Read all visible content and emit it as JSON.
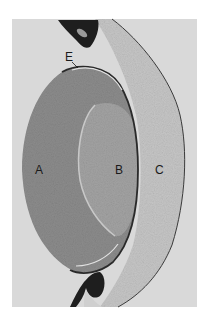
{
  "figure": {
    "type": "grayscale histology micrograph",
    "labels": [
      {
        "id": "A",
        "text": "A",
        "x": 35,
        "y": 164
      },
      {
        "id": "B",
        "text": "B",
        "x": 115,
        "y": 164
      },
      {
        "id": "C",
        "text": "C",
        "x": 155,
        "y": 164
      },
      {
        "id": "E",
        "text": "E",
        "x": 65,
        "y": 51
      }
    ],
    "colors": {
      "background": "#d9d9d9",
      "region_a": "#8c8c8c",
      "region_b": "#a3a3a3",
      "region_c": "#c6c6c6",
      "dark_tissue": "#1e1e1e",
      "edge": "#3a3a3a"
    }
  }
}
